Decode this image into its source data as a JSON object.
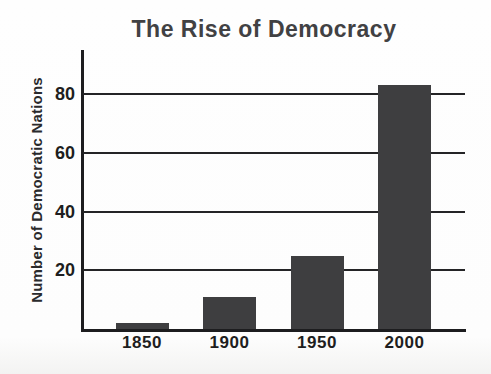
{
  "chart_data": {
    "type": "bar",
    "title": "The Rise of Democracy",
    "ylabel": "Number of Democratic Nations",
    "xlabel": "",
    "categories": [
      "1850",
      "1900",
      "1950",
      "2000"
    ],
    "values": [
      2,
      11,
      25,
      83
    ],
    "yticks": [
      20,
      40,
      60,
      80
    ],
    "ylim": [
      0,
      95
    ],
    "grid": true,
    "legend": false,
    "colors": {
      "bar": "#3e3e40",
      "axis": "#1d1d1f",
      "gridline": "#242426",
      "title_text": "#414143",
      "tick_text": "#1e1e20",
      "background": "#fdfdfd"
    }
  }
}
